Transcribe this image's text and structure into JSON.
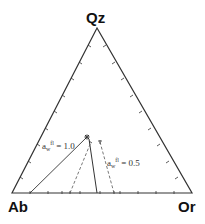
{
  "diagram": {
    "type": "ternary",
    "apexes": {
      "top": {
        "label": "Qz",
        "x": 97,
        "y": 28
      },
      "left": {
        "label": "Ab",
        "x": 12,
        "y": 193
      },
      "right": {
        "label": "Or",
        "x": 192,
        "y": 193
      }
    },
    "annotations": [
      {
        "id": "aw1",
        "base": "a",
        "sub": "w",
        "sup": "fl",
        "value": " = 1.0"
      },
      {
        "id": "aw05",
        "base": "a",
        "sub": "w",
        "sup": "fl",
        "value": " = 0.5"
      }
    ],
    "lines": [
      {
        "name": "aw-1.0-left",
        "style": "solid",
        "x1": 30,
        "y1": 193,
        "x2": 87,
        "y2": 137
      },
      {
        "name": "aw-1.0-right",
        "style": "solid",
        "x1": 97,
        "y1": 193,
        "x2": 89,
        "y2": 139
      },
      {
        "name": "aw-0.5-left",
        "style": "dashed",
        "x1": 70,
        "y1": 193,
        "x2": 91,
        "y2": 142
      },
      {
        "name": "aw-0.5-right",
        "style": "dashed",
        "x1": 114,
        "y1": 193,
        "x2": 100,
        "y2": 142
      }
    ],
    "colors": {
      "line": "#333333",
      "text": "#111111"
    }
  }
}
